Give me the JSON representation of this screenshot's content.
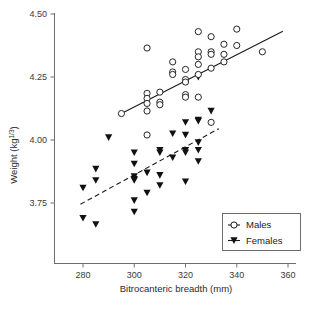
{
  "chart_data": {
    "type": "scatter",
    "title": "",
    "xlabel": "Bitrocanteric breadth (mm)",
    "ylabel_main": "Weight (kg",
    "ylabel_sup": "1/3",
    "ylabel_close": ")",
    "xlim": [
      270,
      362
    ],
    "ylim": [
      3.6,
      4.52
    ],
    "xticks": [
      280,
      300,
      320,
      340,
      360
    ],
    "xtick_labels": [
      "280",
      "300",
      "320",
      "340",
      "360"
    ],
    "yticks": [
      3.75,
      4.0,
      4.25,
      4.5
    ],
    "ytick_labels": [
      "3.75",
      "4.00",
      "4.25",
      "4.50"
    ],
    "grid": false,
    "legend_position": "bottom-right",
    "series": [
      {
        "name": "Males",
        "marker": "open-circle",
        "color": "#1a1a1a",
        "fill": "#ffffff",
        "points": [
          [
            295,
            4.105
          ],
          [
            305,
            4.365
          ],
          [
            305,
            4.185
          ],
          [
            305,
            4.165
          ],
          [
            305,
            4.145
          ],
          [
            305,
            4.115
          ],
          [
            305,
            4.02
          ],
          [
            310,
            4.19
          ],
          [
            310,
            4.15
          ],
          [
            310,
            4.14
          ],
          [
            315,
            4.31
          ],
          [
            315,
            4.27
          ],
          [
            315,
            4.26
          ],
          [
            320,
            4.28
          ],
          [
            320,
            4.24
          ],
          [
            320,
            4.23
          ],
          [
            320,
            4.18
          ],
          [
            320,
            4.17
          ],
          [
            325,
            4.43
          ],
          [
            325,
            4.35
          ],
          [
            325,
            4.33
          ],
          [
            325,
            4.3
          ],
          [
            325,
            4.26
          ],
          [
            325,
            4.17
          ],
          [
            330,
            4.41
          ],
          [
            330,
            4.35
          ],
          [
            330,
            4.34
          ],
          [
            330,
            4.285
          ],
          [
            330,
            4.07
          ],
          [
            335,
            4.38
          ],
          [
            335,
            4.34
          ],
          [
            335,
            4.31
          ],
          [
            340,
            4.44
          ],
          [
            340,
            4.375
          ],
          [
            350,
            4.35
          ]
        ],
        "fit_line": {
          "style": "solid",
          "x1": 295,
          "y1": 4.105,
          "x2": 358,
          "y2": 4.432
        }
      },
      {
        "name": "Females",
        "marker": "filled-triangle-down",
        "color": "#111111",
        "points": [
          [
            280,
            3.81
          ],
          [
            280,
            3.69
          ],
          [
            285,
            3.885
          ],
          [
            285,
            3.84
          ],
          [
            285,
            3.665
          ],
          [
            290,
            4.01
          ],
          [
            300,
            3.95
          ],
          [
            300,
            3.905
          ],
          [
            300,
            3.855
          ],
          [
            300,
            3.845
          ],
          [
            300,
            3.84
          ],
          [
            300,
            3.76
          ],
          [
            300,
            3.715
          ],
          [
            305,
            3.87
          ],
          [
            305,
            3.79
          ],
          [
            310,
            3.96
          ],
          [
            310,
            3.95
          ],
          [
            310,
            3.86
          ],
          [
            310,
            3.82
          ],
          [
            315,
            4.025
          ],
          [
            315,
            3.93
          ],
          [
            320,
            4.07
          ],
          [
            320,
            4.02
          ],
          [
            320,
            3.96
          ],
          [
            320,
            3.95
          ],
          [
            320,
            3.835
          ],
          [
            325,
            4.25
          ],
          [
            325,
            4.08
          ],
          [
            325,
            4.075
          ],
          [
            325,
            3.99
          ],
          [
            325,
            3.96
          ],
          [
            325,
            3.915
          ],
          [
            330,
            4.115
          ]
        ],
        "fit_line": {
          "style": "dashed",
          "x1": 279,
          "y1": 3.745,
          "x2": 333,
          "y2": 4.045
        }
      }
    ]
  },
  "legend": {
    "items": [
      {
        "label": "Males",
        "marker": "open-circle"
      },
      {
        "label": "Females",
        "marker": "filled-triangle-down"
      }
    ]
  },
  "colors": {
    "axis": "#6f6f6f",
    "text": "#2b2b2b",
    "marker": "#121212",
    "background": "#ffffff"
  }
}
